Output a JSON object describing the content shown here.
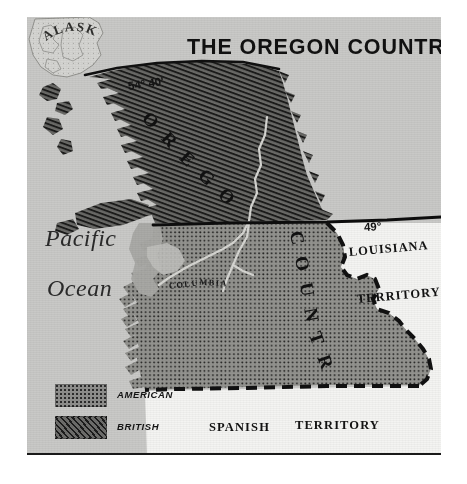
{
  "map": {
    "title": "THE OREGON COUNTRY",
    "ocean": {
      "line1": "Pacific",
      "line2": "Ocean"
    },
    "latitudes": {
      "north_boundary": "54° 40'",
      "treaty_line": "49°"
    },
    "region_labels": {
      "alaska": "ALASKA",
      "oregon_curved": "OREGON",
      "country_curved": "COUNTRY",
      "columbia_river": "COLUMBIA",
      "louisiana": "LOUISIANA",
      "louisiana_territory": "TERRITORY",
      "spanish": "SPANISH",
      "spanish_territory": "TERRITORY"
    },
    "legend": {
      "items": [
        {
          "label": "AMERICAN",
          "pattern": "dotted-stipple",
          "color": "#8e8e8c"
        },
        {
          "label": "BRITISH",
          "pattern": "diagonal-hatch",
          "color": "#6d6d6b"
        }
      ]
    },
    "colors": {
      "ocean": "#c9c9c7",
      "land_neutral": "#f2f2f0",
      "american_fill": "#8e8e8c",
      "british_fill": "#5f5f5d",
      "border_line": "#131313",
      "paper": "#ffffff"
    },
    "boundaries": {
      "treaty_line_49": "solid",
      "continental_divide": "dashed",
      "southern_border": "dashed",
      "north_line_5440": "solid"
    }
  }
}
